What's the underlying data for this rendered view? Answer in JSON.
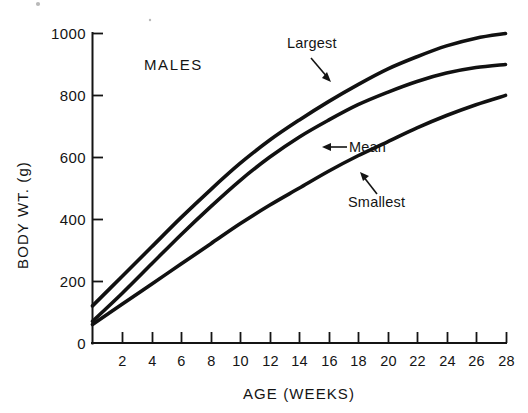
{
  "figure": {
    "panel_label": "MALES",
    "background_color": "#ffffff",
    "ink_color": "#141414"
  },
  "chart_data": {
    "type": "line",
    "title": "MALES",
    "xlabel": "AGE (WEEKS)",
    "ylabel": "BODY WT. (g)",
    "xlim": [
      0,
      28
    ],
    "ylim": [
      0,
      1000
    ],
    "grid": false,
    "legend_position": "inline-annotations",
    "x_ticks": [
      2,
      4,
      6,
      8,
      10,
      12,
      14,
      16,
      18,
      20,
      22,
      24,
      26,
      28
    ],
    "x_tick_labels": [
      "2",
      "4",
      "6",
      "8",
      "10",
      "12",
      "14",
      "16",
      "18",
      "20",
      "22",
      "24",
      "26",
      "28"
    ],
    "y_ticks": [
      0,
      200,
      400,
      600,
      800,
      1000
    ],
    "y_tick_labels": [
      "0",
      "200",
      "400",
      "600",
      "800",
      "1000"
    ],
    "x": [
      0,
      2,
      4,
      6,
      8,
      10,
      12,
      14,
      16,
      18,
      20,
      22,
      24,
      26,
      28
    ],
    "series": [
      {
        "name": "Largest",
        "label": "Largest",
        "values": [
          120,
          215,
          310,
          405,
          495,
          580,
          655,
          720,
          780,
          835,
          885,
          925,
          960,
          985,
          1000
        ]
      },
      {
        "name": "Mean",
        "label": "Mean",
        "values": [
          70,
          160,
          255,
          350,
          440,
          525,
          600,
          665,
          720,
          770,
          810,
          845,
          872,
          890,
          900
        ]
      },
      {
        "name": "Smallest",
        "label": "Smallest",
        "values": [
          60,
          125,
          190,
          255,
          320,
          385,
          445,
          500,
          555,
          605,
          650,
          695,
          735,
          770,
          800
        ]
      }
    ],
    "annotations": [
      {
        "text": "Largest",
        "points_to_series": "Largest",
        "arrow_direction": "down-right"
      },
      {
        "text": "Mean",
        "points_to_series": "Mean",
        "arrow_direction": "left"
      },
      {
        "text": "Smallest",
        "points_to_series": "Smallest",
        "arrow_direction": "up-left"
      }
    ]
  }
}
